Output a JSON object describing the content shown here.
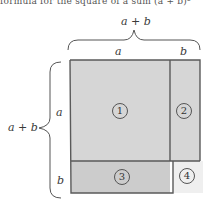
{
  "caption_fragment": "formula for the square of a sum (a + b)²",
  "labels": {
    "top_total": "a + b",
    "top_a": "a",
    "top_b": "b",
    "left_total": "a + b",
    "left_a": "a",
    "left_b": "b"
  },
  "regions": [
    {
      "id": "1",
      "label": "1",
      "fill": "#d6d6d6"
    },
    {
      "id": "2",
      "label": "2",
      "fill": "#d6d6d6"
    },
    {
      "id": "3",
      "label": "3",
      "fill": "#cccccc"
    },
    {
      "id": "4",
      "label": "4",
      "fill": "#efefef"
    }
  ],
  "colors": {
    "stroke": "#5a5a5a",
    "brace": "#555555"
  }
}
